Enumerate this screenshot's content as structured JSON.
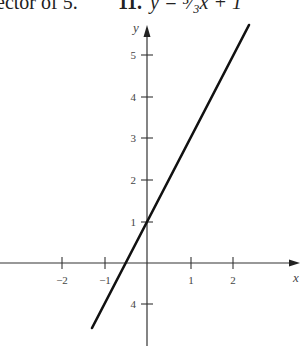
{
  "header": {
    "preceding_text": "ector of 5.",
    "problem_number": "11.",
    "equation": "y = ⁵⁄₃x + 1"
  },
  "chart_data": {
    "type": "line",
    "xlabel": "x",
    "ylabel": "y",
    "x_ticks": [
      "−2",
      "−1",
      "1",
      "2"
    ],
    "y_ticks": [
      "1",
      "2",
      "3",
      "4",
      "5",
      "4"
    ],
    "series": [
      {
        "name": "y = 5/3 x + 1",
        "x": [
          -1.3,
          2.4
        ],
        "y": [
          -1.6,
          5.6
        ]
      }
    ],
    "y_intercept": 1,
    "x_intercept": -0.6,
    "xlim": [
      -3.4,
      3.4
    ],
    "ylim": [
      -2,
      5.8
    ],
    "grid": false,
    "legend": "none"
  },
  "ticks": {
    "x": [
      {
        "label": "−2",
        "px": 62
      },
      {
        "label": "−1",
        "px": 105
      },
      {
        "label": "1",
        "px": 191
      },
      {
        "label": "2",
        "px": 233
      }
    ],
    "y": [
      {
        "label": "5",
        "py": 55
      },
      {
        "label": "4",
        "py": 97
      },
      {
        "label": "3",
        "py": 138
      },
      {
        "label": "2",
        "py": 180
      },
      {
        "label": "1",
        "py": 222
      },
      {
        "label": "4",
        "py": 304
      }
    ]
  },
  "axes": {
    "x_label": "x",
    "y_label": "y"
  }
}
